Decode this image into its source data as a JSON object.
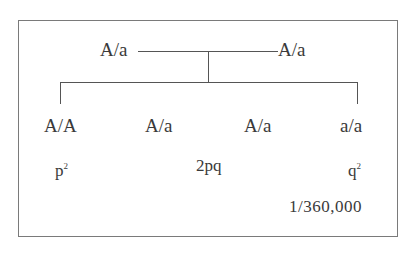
{
  "diagram": {
    "type": "pedigree-cross",
    "parents": [
      {
        "genotype": "A/a"
      },
      {
        "genotype": "A/a"
      }
    ],
    "offspring": [
      {
        "genotype": "A/A"
      },
      {
        "genotype": "A/a"
      },
      {
        "genotype": "A/a"
      },
      {
        "genotype": "a/a"
      }
    ],
    "frequencies": [
      {
        "base": "p",
        "exp": "2"
      },
      {
        "text": "2pq"
      },
      {
        "base": "q",
        "exp": "2"
      }
    ],
    "incidence": "1/360,000",
    "colors": {
      "line": "#555555",
      "border": "#7a7a7a",
      "text": "#3a3a3a"
    }
  }
}
